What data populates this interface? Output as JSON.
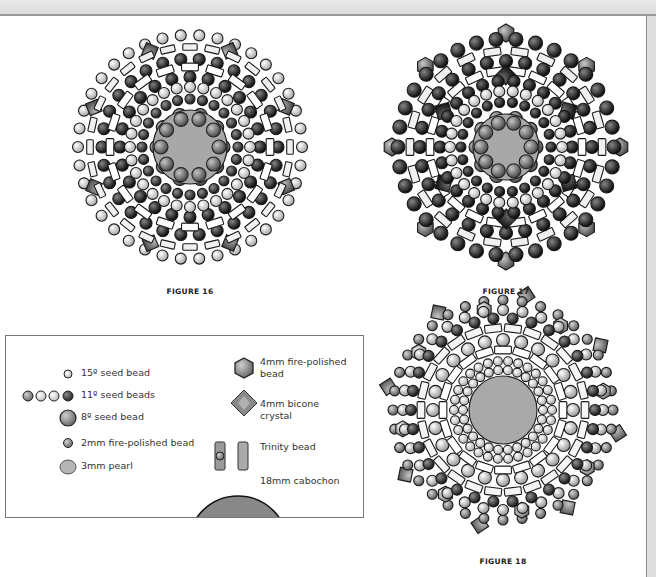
{
  "figures": [
    {
      "id": "figure-16",
      "caption": "FIGURE 16",
      "center": [
        190,
        147
      ],
      "cabochon_radius": 37,
      "cabochon_color": "#a8a8a8",
      "rings": [
        {
          "r": 33,
          "count": 10,
          "size": 7,
          "color": "#888888",
          "type": "round"
        },
        {
          "r": 48,
          "count": 24,
          "size": 5,
          "color": "#555555",
          "type": "round"
        },
        {
          "r": 60,
          "count": 28,
          "size": 5.5,
          "color": "#f2f2f2",
          "type": "round"
        },
        {
          "r": 70,
          "count": 24,
          "size": 6,
          "color": "#444444",
          "type": "round"
        },
        {
          "r": 80,
          "count": 20,
          "size": 7,
          "color": "#ffffff",
          "type": "trinity"
        },
        {
          "r": 88,
          "count": 30,
          "size": 6,
          "color": "#4a4a4a",
          "type": "round"
        },
        {
          "r": 100,
          "count": 28,
          "size": 6,
          "color": "#f0f0f0",
          "type": "trinity"
        },
        {
          "r": 112,
          "count": 38,
          "size": 5.5,
          "color": "#e8e8e8",
          "type": "round"
        },
        {
          "r": 104,
          "count": 8,
          "size": 9,
          "color": "#777777",
          "type": "bicone",
          "offset": 0.39
        }
      ],
      "caption_pos": [
        130,
        287
      ]
    },
    {
      "id": "figure-17",
      "caption": "FIGURE 17",
      "center": [
        506,
        147
      ],
      "cabochon_radius": 33,
      "cabochon_color": "#a8a8a8",
      "rings": [
        {
          "r": 30,
          "count": 10,
          "size": 7,
          "color": "#888888",
          "type": "round"
        },
        {
          "r": 45,
          "count": 22,
          "size": 5,
          "color": "#3a3a3a",
          "type": "round"
        },
        {
          "r": 56,
          "count": 26,
          "size": 5.5,
          "color": "#f4f4f4",
          "type": "round"
        },
        {
          "r": 66,
          "count": 26,
          "size": 6,
          "color": "#333333",
          "type": "round"
        },
        {
          "r": 76,
          "count": 22,
          "size": 7,
          "color": "#ffffff",
          "type": "trinity"
        },
        {
          "r": 86,
          "count": 28,
          "size": 6.5,
          "color": "#3d3d3d",
          "type": "round"
        },
        {
          "r": 96,
          "count": 22,
          "size": 7,
          "color": "#f0f0f0",
          "type": "trinity"
        },
        {
          "r": 108,
          "count": 34,
          "size": 7,
          "color": "#4a4a4a",
          "type": "round"
        },
        {
          "r": 72,
          "count": 6,
          "size": 10,
          "color": "#333333",
          "type": "bicone",
          "offset": 0.52
        },
        {
          "r": 114,
          "count": 8,
          "size": 9,
          "color": "#8c8c8c",
          "type": "hex",
          "offset": 0
        }
      ],
      "caption_pos": [
        446,
        287
      ]
    },
    {
      "id": "figure-18",
      "caption": "FIGURE 18",
      "center": [
        503,
        410
      ],
      "cabochon_radius": 34,
      "cabochon_color": "#a9a9a9",
      "rings": [
        {
          "r": 40,
          "count": 26,
          "size": 4.5,
          "color": "#f4f4f4",
          "type": "round"
        },
        {
          "r": 49,
          "count": 30,
          "size": 4.5,
          "color": "#eeeeee",
          "type": "round"
        },
        {
          "r": 60,
          "count": 20,
          "size": 7,
          "color": "#ffffff",
          "type": "trinity"
        },
        {
          "r": 70,
          "count": 24,
          "size": 6.5,
          "color": "#d6d6d6",
          "type": "round"
        },
        {
          "r": 82,
          "count": 26,
          "size": 7,
          "color": "#f5f5f5",
          "type": "trinity"
        },
        {
          "r": 92,
          "count": 30,
          "size": 5.5,
          "color": "#555555",
          "type": "round"
        },
        {
          "r": 100,
          "count": 32,
          "size": 5.5,
          "color": "#cfcfcf",
          "type": "round"
        },
        {
          "r": 110,
          "count": 36,
          "size": 5,
          "color": "#999999",
          "type": "round"
        },
        {
          "r": 117,
          "count": 8,
          "size": 9,
          "color": "#8a8a8a",
          "type": "bicone",
          "offset": 0.2
        },
        {
          "r": 102,
          "count": 8,
          "size": 8,
          "color": "#bdbdbd",
          "type": "hex",
          "offset": 0.6
        }
      ],
      "caption_pos": [
        443,
        557
      ]
    }
  ],
  "legend": {
    "items": [
      {
        "label": "15º seed bead",
        "x": 75,
        "y": 31,
        "icon": "seed-15-icon"
      },
      {
        "label": "11º seed beads",
        "x": 75,
        "y": 53,
        "icon": "seed-11-icon"
      },
      {
        "label": "8º seed bead",
        "x": 75,
        "y": 75,
        "icon": "seed-8-icon"
      },
      {
        "label": "2mm fire-polished bead",
        "x": 75,
        "y": 101,
        "icon": "fp-2mm-icon"
      },
      {
        "label": "3mm pearl",
        "x": 75,
        "y": 124,
        "icon": "pearl-icon"
      },
      {
        "label": "4mm fire-polished\nbead",
        "x": 254,
        "y": 20,
        "icon": "fp-4mm-icon"
      },
      {
        "label": "4mm bicone\ncrystal",
        "x": 254,
        "y": 62,
        "icon": "bicone-icon"
      },
      {
        "label": "Trinity bead",
        "x": 254,
        "y": 105,
        "icon": "trinity-icon"
      },
      {
        "label": "18mm cabochon",
        "x": 254,
        "y": 139,
        "icon": "cabochon-icon"
      }
    ]
  },
  "colors": {
    "page": "#ffffff",
    "background": "#e4e4e4",
    "stroke": "#1a1a1a"
  }
}
